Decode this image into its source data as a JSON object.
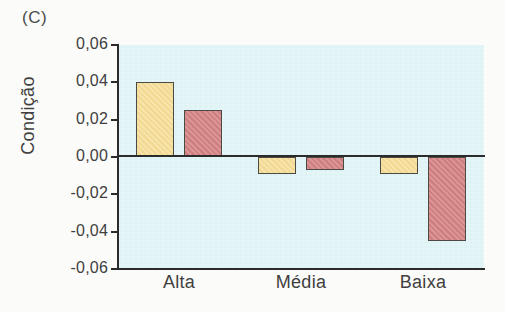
{
  "panel": {
    "label": "(C)"
  },
  "chart_data": {
    "type": "bar",
    "title": "(C)",
    "xlabel": "",
    "ylabel": "Condição",
    "categories": [
      "Alta",
      "Média",
      "Baixa"
    ],
    "series": [
      {
        "name": "series-1",
        "color": "#f6dd96",
        "values": [
          0.04,
          -0.009,
          -0.009
        ]
      },
      {
        "name": "series-2",
        "color": "#d58283",
        "values": [
          0.025,
          -0.007,
          -0.045
        ]
      }
    ],
    "ylim": [
      -0.06,
      0.06
    ],
    "ytick_values": [
      0.06,
      0.04,
      0.02,
      0.0,
      -0.02,
      -0.04,
      -0.06
    ],
    "ytick_labels": [
      "0,06",
      "0,04",
      "0,02",
      "0,00",
      "-0,02",
      "-0,04",
      "-0,06"
    ],
    "grid": false,
    "legend": "none",
    "zero_line": true,
    "plot_background": "#daf1f4",
    "decimal_separator": ","
  }
}
